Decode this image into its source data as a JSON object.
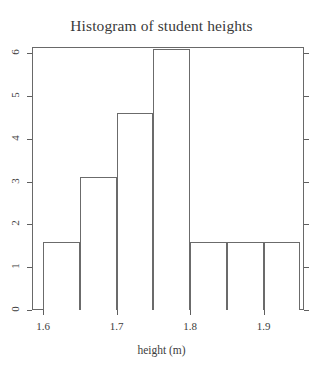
{
  "chart_data": {
    "type": "bar",
    "title": "Histogram of student heights",
    "xlabel": "height (m)",
    "ylabel": "",
    "categories": [
      "1.60-1.65",
      "1.65-1.70",
      "1.70-1.75",
      "1.75-1.80",
      "1.80-1.85",
      "1.85-1.90",
      "1.90-1.95"
    ],
    "bin_edges": [
      1.6,
      1.65,
      1.7,
      1.75,
      1.8,
      1.85,
      1.9,
      1.95
    ],
    "values": [
      1.6,
      3.1,
      4.6,
      6.1,
      1.6,
      1.6,
      1.6
    ],
    "xlim": [
      1.585,
      1.955
    ],
    "ylim": [
      0,
      6.15
    ],
    "xticks": [
      "1.6",
      "1.7",
      "1.8",
      "1.9"
    ],
    "xtick_values": [
      1.6,
      1.7,
      1.8,
      1.9
    ],
    "yticks": [
      "0",
      "1",
      "2",
      "3",
      "4",
      "5",
      "6"
    ],
    "ytick_values": [
      0,
      1,
      2,
      3,
      4,
      5,
      6
    ],
    "grid": false,
    "legend": "none",
    "bar_fill": "#ffffff",
    "bar_outline": "#6b6b6b",
    "axis_color": "#5f5f5f",
    "text_color": "#3d3d3d"
  }
}
